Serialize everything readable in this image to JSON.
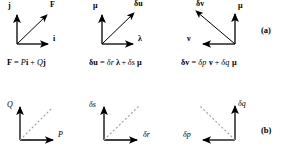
{
  "figure": {
    "rows": [
      {
        "tag": "(a)"
      },
      {
        "tag": "(b)"
      }
    ]
  },
  "panels_a": [
    {
      "name": "force-decomposition",
      "axis_vertical_label": "j",
      "axis_horizontal_label": "i",
      "resultant_label": "F",
      "equation": "F = Pi + Qj",
      "equation_parts": {
        "lhs": "F",
        "eq": "=",
        "t1": "P",
        "b1": "i",
        "plus": "+",
        "t2": "Q",
        "b2": "j"
      }
    },
    {
      "name": "delta-u-decomposition",
      "axis_vertical_label": "μ",
      "axis_horizontal_label": "λ",
      "resultant_label": "δu",
      "equation": "δu = δr λ + δs μ",
      "equation_parts": {
        "lhs": "δu",
        "eq": "=",
        "t1": "δr",
        "b1": "λ",
        "plus": "+",
        "t2": "δs",
        "b2": "μ"
      }
    },
    {
      "name": "delta-v-decomposition",
      "axis_vertical_label": "μ",
      "axis_horizontal_label": "ν",
      "resultant_label": "δv",
      "equation": "δv = δp ν + δq μ",
      "equation_parts": {
        "lhs": "δv",
        "eq": "=",
        "t1": "δp",
        "b1": "ν",
        "plus": "+",
        "t2": "δq",
        "b2": "μ"
      }
    }
  ],
  "panels_b": [
    {
      "name": "pq-component-axes",
      "axis_vertical_label": "Q",
      "axis_horizontal_label": "P"
    },
    {
      "name": "dr-ds-component-axes",
      "axis_vertical_label": "δs",
      "axis_horizontal_label": "δr"
    },
    {
      "name": "dp-dq-component-axes",
      "axis_vertical_label": "δq",
      "axis_horizontal_label": "δp"
    }
  ],
  "colors": {
    "ink": "#000000",
    "dashed_guide": "#9a9a9a",
    "background": "#ffffff"
  }
}
